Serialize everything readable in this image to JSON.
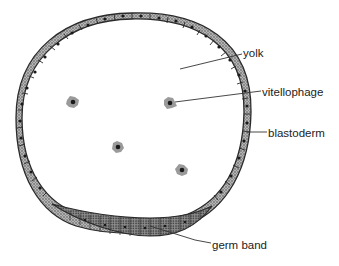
{
  "diagram": {
    "labels": {
      "yolk": "yolk",
      "vitellophage": "vitellophage",
      "blastoderm": "blastoderm",
      "germ_band": "germ band"
    },
    "colors": {
      "background": "#ffffff",
      "outline": "#2a2a2a",
      "cell_fill": "#8a8a8a",
      "nucleus": "#1a1a1a",
      "leader_line": "#333333"
    },
    "vitellophage_count": 4
  }
}
